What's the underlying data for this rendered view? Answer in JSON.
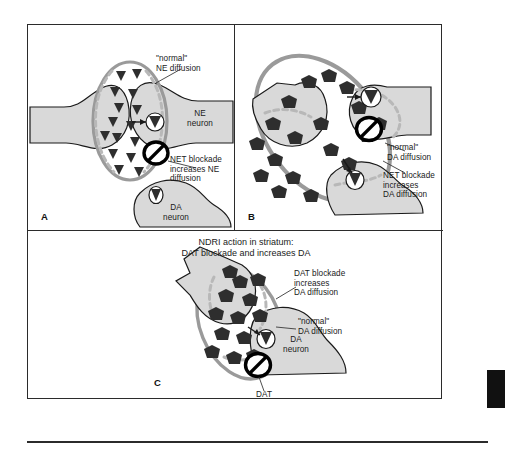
{
  "figure": {
    "domain": "biology-diagram",
    "colors": {
      "neuron_fill": "#d9d9d9",
      "neuron_stroke": "#1a1a1a",
      "diffusion_ring": "#9a9a9a",
      "dashed_membrane": "#b0b0b0",
      "particle_dark": "#2e2e2e",
      "blocked_transporter": "#000000",
      "panel_border": "#2b2b2b",
      "background": "#ffffff"
    }
  },
  "panels": [
    {
      "letter": "A",
      "id": "panel-a",
      "neurons": [
        {
          "name": "NE neuron",
          "label": "NE\nneuron"
        },
        {
          "name": "DA neuron",
          "label": "DA\nneuron"
        }
      ],
      "callouts": [
        {
          "name": "normal-ne-diffusion",
          "text": "\"normal\"\nNE diffusion"
        },
        {
          "name": "net-blockade-ne",
          "text": "NET blockade\nincreases NE\ndiffusion"
        }
      ],
      "particle_type": "triangle",
      "particle_meaning": "NE molecule"
    },
    {
      "letter": "B",
      "id": "panel-b",
      "neurons": [],
      "callouts": [
        {
          "name": "normal-da-diffusion",
          "text": "\"normal\"\nDA diffusion"
        },
        {
          "name": "net-blockade-da",
          "text": "NET blockade\nincreases\nDA diffusion"
        }
      ],
      "particle_type": "pentagon",
      "particle_meaning": "DA molecule"
    },
    {
      "letter": "C",
      "id": "panel-c",
      "title": "NDRI action in striatum:\nDAT blockade and increases DA",
      "neurons": [
        {
          "name": "DA neuron",
          "label": "DA\nneuron"
        }
      ],
      "callouts": [
        {
          "name": "dat-blockade-da",
          "text": "DAT blockade\nincreases\nDA diffusion"
        },
        {
          "name": "normal-da-diffusion",
          "text": "\"normal\"\nDA diffusion"
        },
        {
          "name": "dat-transporter",
          "text": "DAT"
        }
      ],
      "particle_type": "pentagon",
      "particle_meaning": "DA molecule"
    }
  ]
}
